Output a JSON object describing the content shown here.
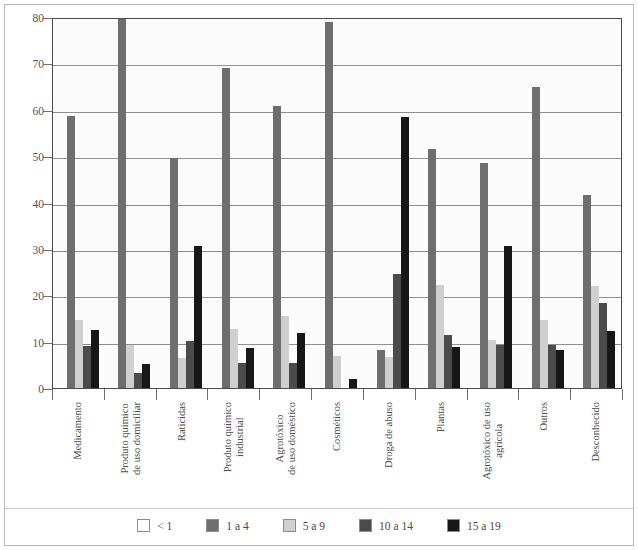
{
  "chart_data": {
    "type": "bar",
    "title": "",
    "subtitle": "",
    "xlabel": "",
    "ylabel": "",
    "ylim": [
      0,
      80
    ],
    "ytick_step": 10,
    "yticks": [
      0,
      10,
      20,
      30,
      40,
      50,
      60,
      70,
      80
    ],
    "grid": true,
    "legend_position": "bottom",
    "grouping": "grouped",
    "categories": [
      "Medicamento",
      "Produto químico de uso domiciliar",
      "Raticidas",
      "Produto químico industrial",
      "Agrotóxico de uso doméstico",
      "Cosméticos",
      "Droga de abuso",
      "Plantas",
      "Agrotóxico de uso agrícola",
      "Outros",
      "Desconhecido"
    ],
    "category_lines": [
      [
        "Medicamento"
      ],
      [
        "Produto químico",
        "de uso domiciliar"
      ],
      [
        "Raticidas"
      ],
      [
        "Produto químico",
        "industrial"
      ],
      [
        "Agrotóxico",
        "de uso doméstico"
      ],
      [
        "Cosméticos"
      ],
      [
        "Droga de abuso"
      ],
      [
        "Plantas"
      ],
      [
        "Agrotóxico de uso",
        "agrícola"
      ],
      [
        "Outros"
      ],
      [
        "Desconhecido"
      ]
    ],
    "series": [
      {
        "name": "< 1",
        "color": "#ffffff",
        "values": [
          0,
          0,
          0,
          0,
          0,
          0,
          0,
          0,
          0,
          0,
          0
        ]
      },
      {
        "name": "1 a 4",
        "color": "#6e6e6e",
        "values": [
          58.7,
          80.0,
          49.7,
          69.0,
          60.8,
          79.0,
          8.3,
          51.6,
          48.6,
          65.0,
          41.6
        ]
      },
      {
        "name": "5 a 9",
        "color": "#cfcfcf",
        "values": [
          14.7,
          9.3,
          6.5,
          12.7,
          15.6,
          6.8,
          6.7,
          22.2,
          10.4,
          14.6,
          22.1
        ]
      },
      {
        "name": "10 a 14",
        "color": "#4b4b4b",
        "values": [
          9.0,
          3.2,
          10.2,
          5.5,
          5.3,
          0,
          24.6,
          11.4,
          9.2,
          9.3,
          18.3
        ]
      },
      {
        "name": "15 a 19",
        "color": "#171717",
        "values": [
          12.6,
          5.1,
          30.6,
          8.6,
          11.9,
          2.0,
          58.4,
          8.8,
          30.6,
          8.2,
          12.4
        ]
      }
    ]
  },
  "legend": {
    "items": [
      {
        "label": "< 1"
      },
      {
        "label": "1 a 4"
      },
      {
        "label": "5 a 9"
      },
      {
        "label": "10 a 14"
      },
      {
        "label": "15 a 19"
      }
    ]
  }
}
